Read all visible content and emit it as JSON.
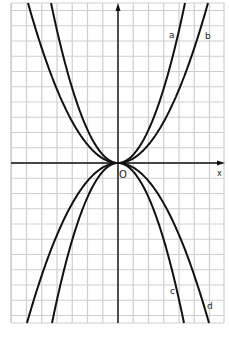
{
  "chart_data": {
    "type": "line",
    "title": "",
    "xlabel": "x",
    "ylabel": "",
    "origin_label": "O",
    "grid": true,
    "series": [
      {
        "name": "a",
        "equation_form": "y = k1·x², k1 > 0 (narrower upward)",
        "direction": "up"
      },
      {
        "name": "b",
        "equation_form": "y = k2·x², 0 < k2 < k1 (wider upward)",
        "direction": "up"
      },
      {
        "name": "c",
        "equation_form": "y = -k1·x² (narrower downward)",
        "direction": "down"
      },
      {
        "name": "d",
        "equation_form": "y = -k2·x² (wider downward)",
        "direction": "down"
      }
    ],
    "colors": {
      "grid": "#cfcfcf",
      "curve": "#111111",
      "axis": "#111111"
    }
  },
  "labels": {
    "a": "a",
    "b": "b",
    "c": "c",
    "d": "d",
    "x_axis": "x",
    "origin": "O"
  }
}
